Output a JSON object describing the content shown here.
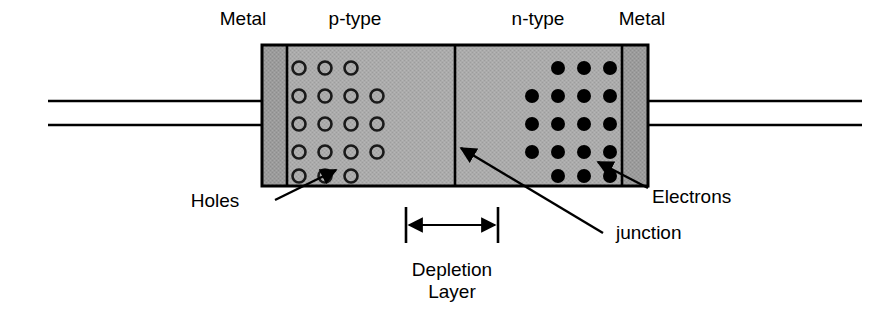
{
  "diagram": {
    "colors": {
      "body_fill": "#a9a9a9",
      "metal_fill": "#999999",
      "outline": "#000000",
      "background": "#ffffff",
      "text": "#000000"
    },
    "top_labels": [
      {
        "name": "metal-left",
        "text": "Metal",
        "x": 243,
        "y": 8
      },
      {
        "name": "p-type",
        "text": "p-type",
        "x": 355,
        "y": 8
      },
      {
        "name": "n-type",
        "text": "n-type",
        "x": 538,
        "y": 8
      },
      {
        "name": "metal-right",
        "text": "Metal",
        "x": 642,
        "y": 8
      }
    ],
    "annotations": [
      {
        "name": "holes",
        "text": "Holes",
        "x": 215,
        "y": 190
      },
      {
        "name": "electrons",
        "text": "Electrons",
        "x": 652,
        "y": 186
      },
      {
        "name": "junction",
        "text": "junction",
        "x": 616,
        "y": 222
      },
      {
        "name": "depletion-layer-line1",
        "text": "Depletion",
        "x": 452,
        "y": 259
      },
      {
        "name": "depletion-layer-line2",
        "text": "Layer",
        "x": 452,
        "y": 281
      }
    ],
    "regions": {
      "body": {
        "x": 262,
        "y": 45,
        "width": 386,
        "height": 141
      },
      "metal_left": {
        "x": 262,
        "y": 45,
        "width": 25,
        "height": 141
      },
      "metal_right": {
        "x": 622,
        "y": 45,
        "width": 26,
        "height": 141
      },
      "p_type": {
        "x": 287,
        "y": 45,
        "width": 168,
        "height": 141
      },
      "n_type": {
        "x": 455,
        "y": 45,
        "width": 167,
        "height": 141
      },
      "junction_x": 455
    },
    "carriers": {
      "hole_symbol": "open-circle",
      "electron_symbol": "filled-circle",
      "radius": 6.5,
      "row_counts": [
        3,
        4,
        4,
        4,
        3
      ],
      "rows_y": [
        68,
        96,
        124,
        152,
        176
      ],
      "hole_col_start_x": 299,
      "electron_col_end_x": 610,
      "spacing": 26
    },
    "depletion_bracket": {
      "x1": 406,
      "x2": 498,
      "y": 225,
      "cap_top": 207,
      "cap_bottom": 243
    },
    "leads": {
      "left": {
        "x1": 48,
        "x2": 262,
        "y_top": 101,
        "y_bottom": 125
      },
      "right": {
        "x1": 648,
        "x2": 862,
        "y_top": 101,
        "y_bottom": 125
      }
    }
  }
}
